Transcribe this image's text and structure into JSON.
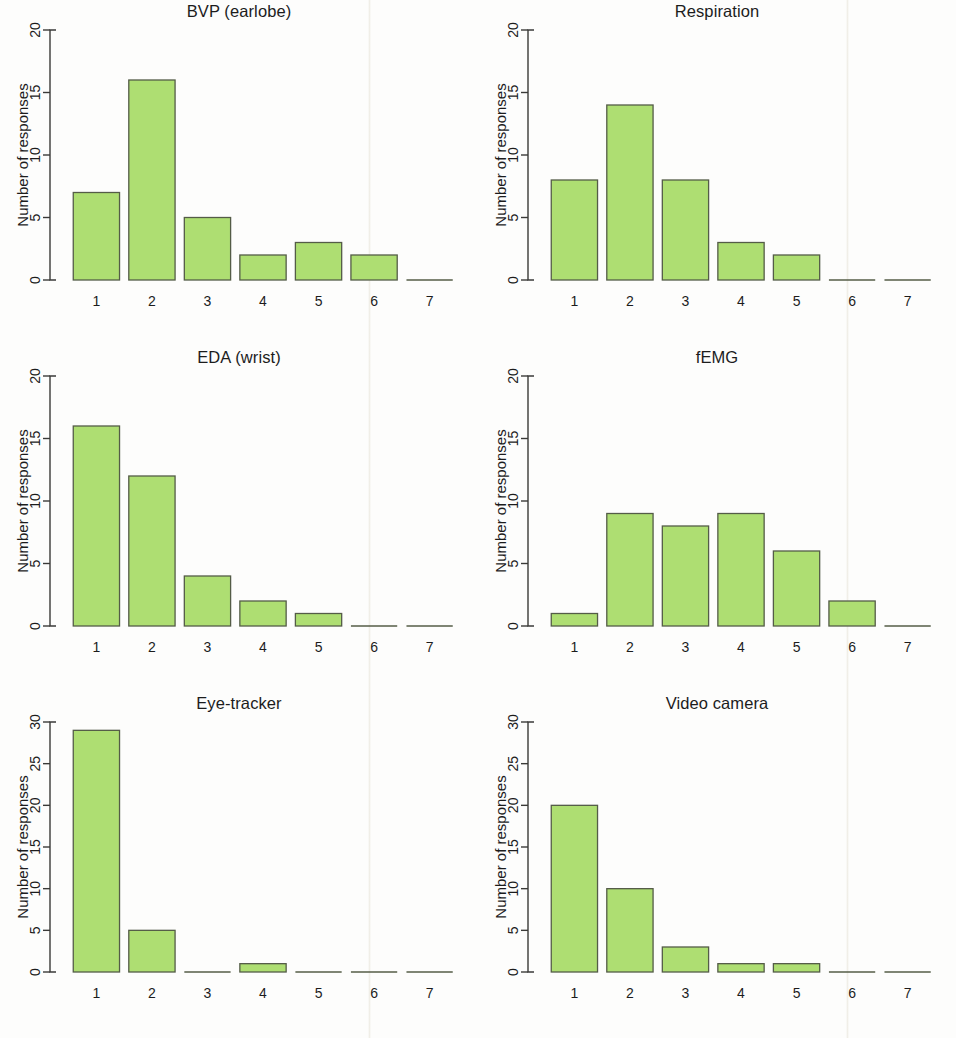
{
  "figure": {
    "y_axis_label": "Number of responses",
    "x_categories": [
      "1",
      "2",
      "3",
      "4",
      "5",
      "6",
      "7"
    ],
    "bar_fill_color": "#aede72",
    "bar_border_color": "#545c47",
    "axis_color": "#3a3a38",
    "background_color": "#fdfdfc"
  },
  "chart_data": [
    {
      "type": "bar",
      "title": "BVP (earlobe)",
      "categories": [
        "1",
        "2",
        "3",
        "4",
        "5",
        "6",
        "7"
      ],
      "values": [
        7,
        16,
        5,
        2,
        3,
        2,
        0
      ],
      "xlabel": "",
      "ylabel": "Number of responses",
      "ylim": [
        0,
        20
      ],
      "yticks": [
        0,
        5,
        10,
        15,
        20
      ],
      "grid": false,
      "legend": "none"
    },
    {
      "type": "bar",
      "title": "Respiration",
      "categories": [
        "1",
        "2",
        "3",
        "4",
        "5",
        "6",
        "7"
      ],
      "values": [
        8,
        14,
        8,
        3,
        2,
        0,
        0
      ],
      "xlabel": "",
      "ylabel": "Number of responses",
      "ylim": [
        0,
        20
      ],
      "yticks": [
        0,
        5,
        10,
        15,
        20
      ],
      "grid": false,
      "legend": "none"
    },
    {
      "type": "bar",
      "title": "EDA (wrist)",
      "categories": [
        "1",
        "2",
        "3",
        "4",
        "5",
        "6",
        "7"
      ],
      "values": [
        16,
        12,
        4,
        2,
        1,
        0,
        0
      ],
      "xlabel": "",
      "ylabel": "Number of responses",
      "ylim": [
        0,
        20
      ],
      "yticks": [
        0,
        5,
        10,
        15,
        20
      ],
      "grid": false,
      "legend": "none"
    },
    {
      "type": "bar",
      "title": "fEMG",
      "categories": [
        "1",
        "2",
        "3",
        "4",
        "5",
        "6",
        "7"
      ],
      "values": [
        1,
        9,
        8,
        9,
        6,
        2,
        0
      ],
      "xlabel": "",
      "ylabel": "Number of responses",
      "ylim": [
        0,
        20
      ],
      "yticks": [
        0,
        5,
        10,
        15,
        20
      ],
      "grid": false,
      "legend": "none"
    },
    {
      "type": "bar",
      "title": "Eye-tracker",
      "categories": [
        "1",
        "2",
        "3",
        "4",
        "5",
        "6",
        "7"
      ],
      "values": [
        29,
        5,
        0,
        1,
        0,
        0,
        0
      ],
      "xlabel": "",
      "ylabel": "Number of responses",
      "ylim": [
        0,
        30
      ],
      "yticks": [
        0,
        5,
        10,
        15,
        20,
        25,
        30
      ],
      "grid": false,
      "legend": "none"
    },
    {
      "type": "bar",
      "title": "Video camera",
      "categories": [
        "1",
        "2",
        "3",
        "4",
        "5",
        "6",
        "7"
      ],
      "values": [
        20,
        10,
        3,
        1,
        1,
        0,
        0
      ],
      "xlabel": "",
      "ylabel": "Number of responses",
      "ylim": [
        0,
        30
      ],
      "yticks": [
        0,
        5,
        10,
        15,
        20,
        25,
        30
      ],
      "grid": false,
      "legend": "none"
    }
  ]
}
